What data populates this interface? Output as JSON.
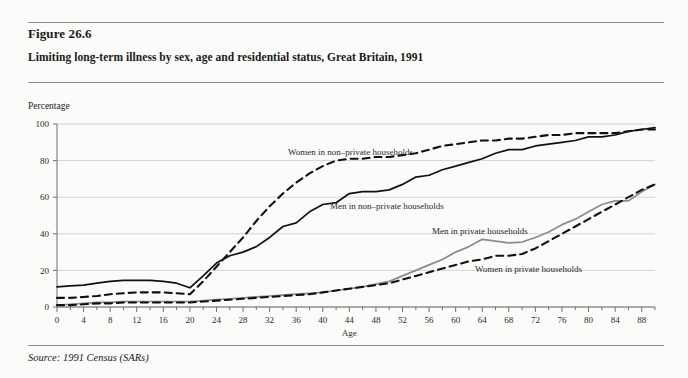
{
  "figure": {
    "number": "Figure 26.6",
    "title": "Limiting long-term illness by sex, age and residential status, Great Britain, 1991",
    "source": "Source: 1991 Census (SARs)"
  },
  "chart_data": {
    "type": "line",
    "title": "Limiting long-term illness by sex, age and residential status, Great Britain, 1991",
    "xlabel": "Age",
    "ylabel": "Percentage",
    "xlim": [
      0,
      90
    ],
    "ylim": [
      0,
      100
    ],
    "xticks": [
      0,
      4,
      8,
      12,
      16,
      20,
      24,
      28,
      32,
      36,
      40,
      44,
      48,
      52,
      56,
      60,
      64,
      68,
      72,
      76,
      80,
      84,
      88
    ],
    "yticks": [
      0,
      20,
      40,
      60,
      80,
      100
    ],
    "grid": "horizontal",
    "legend_position": "inline-annotations",
    "x": [
      0,
      2,
      4,
      6,
      8,
      10,
      12,
      14,
      16,
      18,
      20,
      22,
      24,
      26,
      28,
      30,
      32,
      34,
      36,
      38,
      40,
      42,
      44,
      46,
      48,
      50,
      52,
      54,
      56,
      58,
      60,
      62,
      64,
      66,
      68,
      70,
      72,
      74,
      76,
      78,
      80,
      82,
      84,
      86,
      88,
      90
    ],
    "series": [
      {
        "name": "Men in non-private households",
        "style": "solid",
        "color": "#111111",
        "values": [
          11,
          11.5,
          12,
          13,
          14,
          14.5,
          14.5,
          14.5,
          14,
          13,
          10.5,
          17,
          24,
          28,
          30,
          33,
          38,
          44,
          46,
          52,
          56,
          57,
          62,
          63,
          63,
          64,
          67,
          71,
          72,
          75,
          77,
          79,
          81,
          84,
          86,
          86,
          88,
          89,
          90,
          91,
          93,
          93,
          94,
          96,
          97,
          98
        ]
      },
      {
        "name": "Women in non-private households",
        "style": "dashed",
        "color": "#111111",
        "values": [
          5,
          5,
          5.5,
          6,
          7,
          7.5,
          8,
          8,
          8,
          7.5,
          7,
          14,
          22,
          30,
          38,
          47,
          55,
          62,
          68,
          73,
          77,
          80,
          81,
          81,
          82,
          82,
          83,
          84,
          86,
          88,
          89,
          90,
          91,
          91,
          92,
          92,
          93,
          94,
          94,
          95,
          95,
          95,
          95,
          96,
          97,
          97
        ]
      },
      {
        "name": "Men in private households",
        "style": "solid",
        "color": "#8c8c8c",
        "values": [
          1,
          1.5,
          2,
          2.5,
          2.5,
          3,
          3,
          3,
          3,
          3,
          3,
          3.5,
          4,
          4.5,
          5,
          5.5,
          6,
          6.5,
          7,
          7.5,
          8,
          9,
          10,
          11,
          12.5,
          14,
          17,
          20,
          23,
          26,
          30,
          33,
          37,
          36,
          35,
          35.5,
          38,
          41,
          45,
          48,
          52,
          56,
          58,
          58,
          63,
          67
        ]
      },
      {
        "name": "Women in private households",
        "style": "dashed",
        "color": "#111111",
        "values": [
          1,
          1,
          1.5,
          2,
          2,
          2.5,
          2.5,
          2.5,
          2.5,
          2.5,
          2.5,
          3,
          3.5,
          4,
          4.5,
          5,
          5.5,
          6,
          6.5,
          7,
          8,
          9,
          10,
          11,
          12,
          13,
          15,
          17,
          19,
          21,
          23,
          25,
          26,
          28,
          28,
          29,
          32,
          36,
          40,
          44,
          48,
          52,
          56,
          60,
          64,
          67
        ]
      }
    ],
    "annotations": [
      {
        "text": "Women in non-private households",
        "x_px": 288,
        "y_px": 155
      },
      {
        "text": "Men in non-private households",
        "x_px": 330,
        "y_px": 209
      },
      {
        "text": "Men in private households",
        "x_px": 432,
        "y_px": 234
      },
      {
        "text": "Women in private households",
        "x_px": 475,
        "y_px": 272
      }
    ]
  }
}
